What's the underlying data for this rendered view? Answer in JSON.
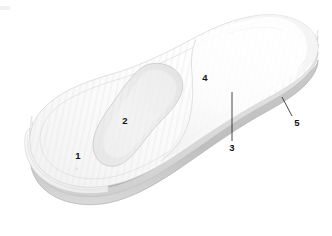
{
  "figure": {
    "kind": "technical-line-drawing",
    "background_color": "#ffffff",
    "reference_numerals": [
      {
        "id": "1",
        "label": "1",
        "meaning": "heel region top surface",
        "x": 78,
        "y": 156,
        "has_leader": false
      },
      {
        "id": "2",
        "label": "2",
        "meaning": "arch support pad insert",
        "x": 125,
        "y": 121,
        "has_leader": false
      },
      {
        "id": "3",
        "label": "3",
        "meaning": "intermediate cushioning layer",
        "x": 232,
        "y": 148,
        "has_leader": true,
        "leader": {
          "x1": 232,
          "y1": 141,
          "x2": 232,
          "y2": 92
        }
      },
      {
        "id": "4",
        "label": "4",
        "meaning": "forefoot top cover surface",
        "x": 205,
        "y": 78,
        "has_leader": false
      },
      {
        "id": "5",
        "label": "5",
        "meaning": "outer peripheral edge band",
        "x": 297,
        "y": 123,
        "has_leader": true,
        "leader": {
          "x1": 292,
          "y1": 116,
          "x2": 282,
          "y2": 97
        }
      }
    ],
    "palette": {
      "outline_faint": "#d8d8d8",
      "outline_mid": "#bdbdbd",
      "outline_dark": "#9a9a9a",
      "surface_light": "#fbfbfb",
      "surface_shade": "#f2f2f2",
      "layer_light": "#f0f0f0",
      "layer_mid": "#d6d6d6",
      "layer_dark": "#b0b0b0",
      "numeral_color": "#121212",
      "leader_color": "#1a1a1a"
    },
    "layer_bands": [
      {
        "name": "top-cover",
        "tone": "#f6f6f6"
      },
      {
        "name": "upper-foam",
        "tone": "#e4e4e4"
      },
      {
        "name": "mid-cushion",
        "tone": "#bcbcbc"
      },
      {
        "name": "lower-foam",
        "tone": "#dedede"
      },
      {
        "name": "base-plate",
        "tone": "#c9c9c9"
      }
    ]
  }
}
